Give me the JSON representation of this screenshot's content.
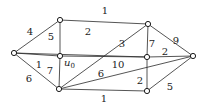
{
  "diagram": {
    "type": "weighted-undirected-graph",
    "nodes": [
      {
        "id": "a",
        "x": 14,
        "y": 53,
        "label": ""
      },
      {
        "id": "b",
        "x": 60,
        "y": 20,
        "label": ""
      },
      {
        "id": "c",
        "x": 148,
        "y": 24,
        "label": ""
      },
      {
        "id": "u0",
        "x": 60,
        "y": 56,
        "label": "u",
        "sub": "0"
      },
      {
        "id": "d",
        "x": 147,
        "y": 57,
        "label": ""
      },
      {
        "id": "e",
        "x": 59,
        "y": 89,
        "label": ""
      },
      {
        "id": "f",
        "x": 147,
        "y": 91,
        "label": ""
      },
      {
        "id": "g",
        "x": 193,
        "y": 56,
        "label": ""
      }
    ],
    "edges": [
      {
        "from": "a",
        "to": "b",
        "weight": "4",
        "lx": 30,
        "ly": 35
      },
      {
        "from": "a",
        "to": "d",
        "weight": "2",
        "lx": 88,
        "ly": 35
      },
      {
        "from": "a",
        "to": "u0",
        "weight": "1",
        "lx": 39,
        "ly": 68
      },
      {
        "from": "a",
        "to": "e",
        "weight": "6",
        "lx": 29,
        "ly": 82
      },
      {
        "from": "b",
        "to": "c",
        "weight": "1",
        "lx": 105,
        "ly": 14
      },
      {
        "from": "b",
        "to": "u0",
        "weight": "5",
        "lx": 51,
        "ly": 40
      },
      {
        "from": "u0",
        "to": "e",
        "weight": "7",
        "lx": 50,
        "ly": 74
      },
      {
        "from": "u0",
        "to": "d",
        "weight": "10",
        "lx": 118,
        "ly": 68
      },
      {
        "from": "c",
        "to": "e",
        "weight": "3",
        "lx": 122,
        "ly": 47
      },
      {
        "from": "c",
        "to": "d",
        "weight": "7",
        "lx": 152,
        "ly": 47
      },
      {
        "from": "c",
        "to": "g",
        "weight": "9",
        "lx": 176,
        "ly": 44
      },
      {
        "from": "e",
        "to": "g",
        "weight": "6",
        "lx": 101,
        "ly": 77
      },
      {
        "from": "e",
        "to": "f",
        "weight": "1",
        "lx": 104,
        "ly": 102
      },
      {
        "from": "d",
        "to": "g",
        "weight": "2",
        "lx": 165,
        "ly": 55
      },
      {
        "from": "d",
        "to": "f",
        "weight": "2",
        "lx": 140,
        "ly": 84
      },
      {
        "from": "f",
        "to": "g",
        "weight": "5",
        "lx": 170,
        "ly": 90
      }
    ]
  }
}
